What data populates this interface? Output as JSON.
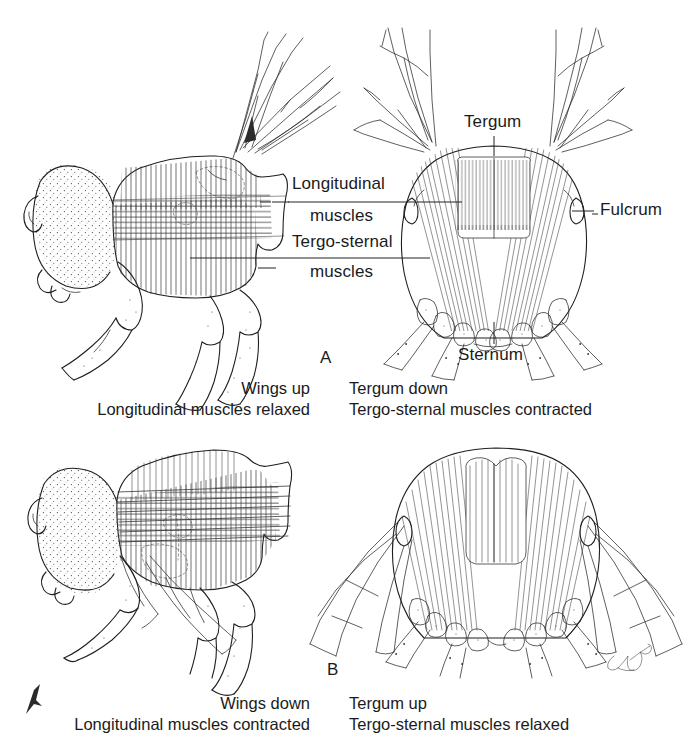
{
  "figure": {
    "type": "scientific-line-diagram",
    "background": "#ffffff",
    "ink_color": "#1f1f1f"
  },
  "panels": [
    {
      "id": "A",
      "id_label": "A",
      "views": [
        "lateral-thorax-wings-up",
        "cross-section-tergum-down"
      ],
      "caption_left": [
        "Wings up",
        "Longitudinal muscles relaxed"
      ],
      "caption_right": [
        "Tergum down",
        "Tergo-sternal muscles contracted"
      ]
    },
    {
      "id": "B",
      "id_label": "B",
      "views": [
        "lateral-thorax-wings-down",
        "cross-section-tergum-up"
      ],
      "caption_left": [
        "Wings down",
        "Longitudinal muscles contracted"
      ],
      "caption_right": [
        "Tergum up",
        "Tergo-sternal muscles relaxed"
      ]
    }
  ],
  "labels": {
    "longitudinal_muscles_line1": "Longitudinal",
    "longitudinal_muscles_line2": "muscles",
    "tergo_sternal_muscles_line1": "Tergo-sternal",
    "tergo_sternal_muscles_line2": "muscles",
    "tergum": "Tergum",
    "sternum": "Sternum",
    "fulcrum": "Fulcrum"
  },
  "captions": {
    "a_left_line1": "Wings up",
    "a_left_line2": "Longitudinal muscles relaxed",
    "a_right_line1": "Tergum down",
    "a_right_line2": "Tergo-sternal muscles contracted",
    "b_left_line1": "Wings down",
    "b_left_line2": "Longitudinal muscles contracted",
    "b_right_line1": "Tergum up",
    "b_right_line2": "Tergo-sternal muscles relaxed"
  },
  "panel_ids": {
    "a": "A",
    "b": "B"
  },
  "artist_signature": {
    "present": true,
    "text": ""
  }
}
